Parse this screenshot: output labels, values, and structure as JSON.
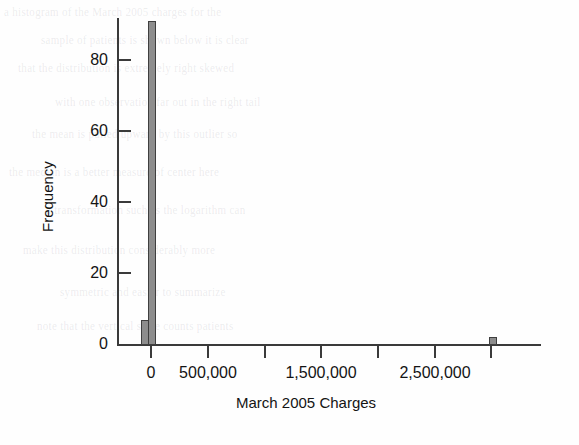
{
  "figure": {
    "kind": "histogram-figure",
    "background_color": "#fefefe"
  },
  "chart_data": {
    "type": "bar",
    "title": "",
    "subtitle": "",
    "xlabel": "March 2005 Charges",
    "ylabel": "Frequency",
    "xlim": [
      -250000,
      3400000
    ],
    "ylim": [
      0,
      94
    ],
    "grid": false,
    "legend": false,
    "legend_position": "none",
    "bar_fill_color": "#8d8d8d",
    "bar_edge_color": "#3f3f3f",
    "axis_color": "#3a3a3a",
    "bin_width": 60000,
    "xticks": [
      0,
      500000,
      1000000,
      1500000,
      2000000,
      2500000,
      3000000
    ],
    "xtick_labels": [
      "0",
      "500,000",
      "",
      "1,500,000",
      "",
      "2,500,000",
      ""
    ],
    "yticks": [
      0,
      20,
      40,
      60,
      80
    ],
    "ytick_labels": [
      "0",
      "20",
      "40",
      "60",
      "80"
    ],
    "categories": [
      "-60000",
      "0",
      "2880000"
    ],
    "bins": [
      {
        "x_left": -60000,
        "x_right": 0,
        "center": -30000,
        "frequency": 7
      },
      {
        "x_left": 0,
        "x_right": 60000,
        "center": 30000,
        "frequency": 91
      },
      {
        "x_left": 2880000,
        "x_right": 2940000,
        "center": 2910000,
        "frequency": 2
      }
    ],
    "values": [
      7,
      91,
      2
    ]
  },
  "bleed_through": {
    "description": "faint mirrored text from the reverse side of the scanned book page",
    "lines": [
      "a histogram of the March 2005 charges for the",
      "sample of patients is shown below it is clear",
      "that the distribution is extremely right skewed",
      "with one observation far out in the right tail",
      "the mean is pulled upward by this outlier so",
      "the median is a better measure of center here",
      "a transformation such as the logarithm can",
      "make this distribution considerably more",
      "symmetric and easier to summarize",
      "note that the vertical scale counts patients"
    ]
  }
}
